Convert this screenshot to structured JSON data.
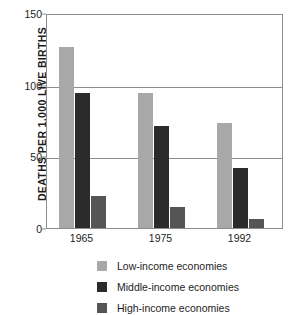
{
  "chart_data": {
    "type": "bar",
    "title": "",
    "subtitle": "",
    "xlabel": "",
    "ylabel": "DEATHS PER 1,000 LIVE BIRTHS",
    "categories": [
      "1965",
      "1975",
      "1992"
    ],
    "ylim": [
      0,
      150
    ],
    "yticks": [
      "0",
      "50",
      "100",
      "150"
    ],
    "ytick_values": [
      0,
      50,
      100,
      150
    ],
    "grid": true,
    "legend_position": "bottom",
    "series": [
      {
        "name": "Low-income economies",
        "color": "#a8a8a8",
        "values": [
          126,
          94,
          73
        ]
      },
      {
        "name": "Middle-income economies",
        "color": "#2b2b2b",
        "values": [
          94,
          71,
          42
        ]
      },
      {
        "name": "High-income economies",
        "color": "#555555",
        "values": [
          22,
          15,
          6
        ]
      }
    ]
  },
  "axes": {
    "y_title": "DEATHS PER 1,000 LIVE BIRTHS",
    "y_ticks": [
      {
        "label": "150",
        "value": 150
      },
      {
        "label": "100",
        "value": 100
      },
      {
        "label": "50",
        "value": 50
      },
      {
        "label": "0",
        "value": 0
      }
    ],
    "x_ticks": [
      {
        "label": "1965"
      },
      {
        "label": "1975"
      },
      {
        "label": "1992"
      }
    ]
  },
  "legend": {
    "items": [
      {
        "label": "Low-income economies",
        "swatch": "low"
      },
      {
        "label": "Middle-income economies",
        "swatch": "middle"
      },
      {
        "label": "High-income economies",
        "swatch": "high"
      }
    ]
  }
}
